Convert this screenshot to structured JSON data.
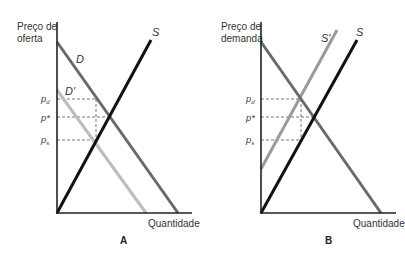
{
  "colors": {
    "axis": "#222222",
    "demand": "#6a6a6a",
    "supply": "#111111",
    "shifted": "#b8b8b8",
    "dashed": "#555555"
  },
  "panels": [
    {
      "id": "A",
      "panel_label": "A",
      "y_axis_title_line1": "Preço de",
      "y_axis_title_line2": "oferta",
      "x_axis_title": "Quantidade",
      "curves": {
        "demand": "D",
        "demand_shifted": "D'",
        "supply": "S"
      },
      "price_labels": {
        "pd_main": "p",
        "pd_sub": "d",
        "pstar": "p*",
        "ps_main": "p",
        "ps_sub": "s"
      }
    },
    {
      "id": "B",
      "panel_label": "B",
      "y_axis_title_line1": "Preço de",
      "y_axis_title_line2": "demanda",
      "x_axis_title": "Quantidade",
      "curves": {
        "demand": "",
        "supply_shifted": "S'",
        "supply": "S"
      },
      "price_labels": {
        "pd_main": "p",
        "pd_sub": "d",
        "pstar": "p*",
        "ps_main": "p",
        "ps_sub": "s"
      }
    }
  ]
}
